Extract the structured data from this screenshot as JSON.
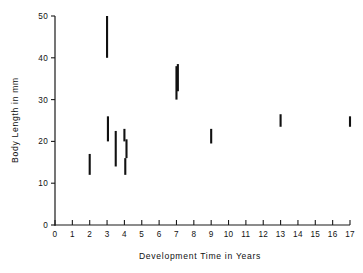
{
  "chart_data": {
    "type": "scatter",
    "title": "",
    "xlabel": "Development Time in Years",
    "ylabel": "Body Length in mm",
    "xlim": [
      0,
      17
    ],
    "ylim": [
      0,
      50
    ],
    "xticks": [
      0,
      1,
      2,
      3,
      4,
      5,
      6,
      7,
      8,
      9,
      10,
      11,
      12,
      13,
      14,
      15,
      16,
      17
    ],
    "xtick_labels": [
      "0",
      "1",
      "2",
      "3",
      "4",
      "5",
      "6",
      "7",
      "8",
      "9",
      "10",
      "11",
      "12",
      "13",
      "14",
      "15",
      "16",
      "17"
    ],
    "yticks": [
      0,
      10,
      20,
      30,
      40,
      50
    ],
    "ytick_labels": [
      "0",
      "10",
      "20",
      "30",
      "40",
      "50"
    ],
    "grid": false,
    "legend": "none",
    "marker_style": "vertical-range-bar",
    "series": [
      {
        "name": "Body length range",
        "color": "#111111",
        "ranges": [
          {
            "x": 2.0,
            "y_min": 12.0,
            "y_max": 17.0
          },
          {
            "x": 3.0,
            "y_min": 40.0,
            "y_max": 50.0
          },
          {
            "x": 3.05,
            "y_min": 20.0,
            "y_max": 26.0
          },
          {
            "x": 3.5,
            "y_min": 14.0,
            "y_max": 22.5
          },
          {
            "x": 4.0,
            "y_min": 20.0,
            "y_max": 23.0
          },
          {
            "x": 4.05,
            "y_min": 12.0,
            "y_max": 16.0
          },
          {
            "x": 4.12,
            "y_min": 16.0,
            "y_max": 20.5
          },
          {
            "x": 7.0,
            "y_min": 30.0,
            "y_max": 38.0
          },
          {
            "x": 7.08,
            "y_min": 32.0,
            "y_max": 38.5
          },
          {
            "x": 9.0,
            "y_min": 19.5,
            "y_max": 23.0
          },
          {
            "x": 13.0,
            "y_min": 23.5,
            "y_max": 26.5
          },
          {
            "x": 17.0,
            "y_min": 23.5,
            "y_max": 26.0
          }
        ]
      }
    ]
  }
}
